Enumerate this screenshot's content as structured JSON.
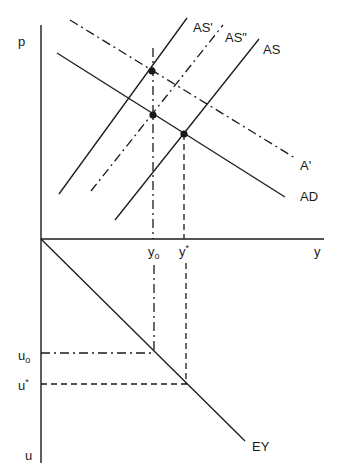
{
  "diagram": {
    "type": "economics-four-quadrant-diagram",
    "axes": {
      "price": "p",
      "output": "y",
      "unemployment": "u"
    },
    "curves": {
      "as_prime": "AS'",
      "as_double_prime": "AS\"",
      "as": "AS",
      "ad_prime": "A'",
      "ad": "AD",
      "ey": "EY"
    },
    "output_ticks": {
      "y0": "y",
      "y0_sub": "o",
      "ystar": "y",
      "ystar_sup": "*"
    },
    "unemployment_ticks": {
      "u0": "u",
      "u0_sub": "o",
      "ustar": "u",
      "ustar_sup": "*"
    },
    "equilibria": [
      {
        "name": "AS'-A' intersection",
        "at": "y0"
      },
      {
        "name": "AS''-AD intersection",
        "at": "y0"
      },
      {
        "name": "AS-AD intersection",
        "at": "y*"
      }
    ],
    "colors": {
      "ink": "#1a1a1a",
      "background": "#ffffff"
    }
  }
}
